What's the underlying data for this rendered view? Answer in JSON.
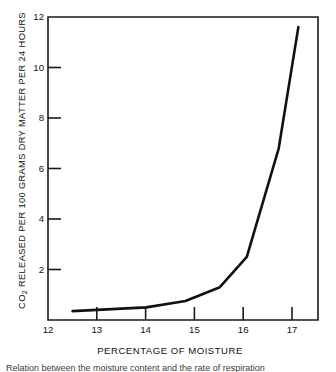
{
  "figure": {
    "background_color": "#ffffff",
    "line_color": "#111111",
    "axis_color": "#1a1a1a"
  },
  "axes": {
    "x_title": "PERCENTAGE OF MOISTURE",
    "y_title_prefix": "CO",
    "y_title_subscript": "2",
    "y_title_rest": " RELEASED PER 100 GRAMS DRY MATTER PER 24 HOURS",
    "x_ticks": [
      "12",
      "13",
      "14",
      "15",
      "16",
      "17"
    ],
    "y_ticks": [
      "2",
      "4",
      "6",
      "8",
      "10",
      "12"
    ]
  },
  "caption": {
    "text": "Relation between the moisture content and the rate of respiration"
  },
  "chart_data": {
    "type": "line",
    "title": "",
    "xlabel": "PERCENTAGE OF MOISTURE",
    "ylabel": "CO2 RELEASED PER 100 GRAMS DRY MATTER PER 24 HOURS",
    "xlim": [
      12,
      17.5
    ],
    "ylim": [
      0,
      12
    ],
    "xticks": [
      12,
      13,
      14,
      15,
      16,
      17
    ],
    "yticks": [
      2,
      4,
      6,
      8,
      10,
      12
    ],
    "grid": false,
    "legend": null,
    "series": [
      {
        "name": "CO2 released",
        "x": [
          12.5,
          13.0,
          14.0,
          14.8,
          15.5,
          16.05,
          16.7,
          17.1
        ],
        "y": [
          0.35,
          0.4,
          0.5,
          0.75,
          1.3,
          2.5,
          6.8,
          11.6
        ]
      }
    ]
  }
}
